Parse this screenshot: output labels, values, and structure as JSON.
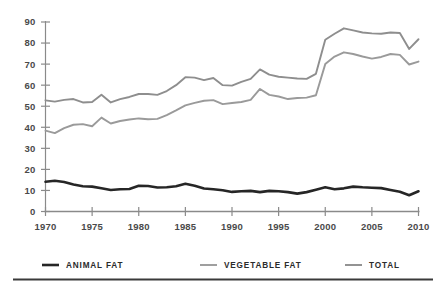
{
  "chart_data": {
    "type": "line",
    "title": "",
    "subtitle": "",
    "xlabel": "",
    "ylabel": "",
    "xlim": [
      1970,
      2010
    ],
    "ylim": [
      0,
      90
    ],
    "grid": false,
    "legend_position": "bottom",
    "y_ticks": [
      0,
      10,
      20,
      30,
      40,
      50,
      60,
      70,
      80,
      90
    ],
    "x_ticks": [
      1970,
      1975,
      1980,
      1985,
      1990,
      1995,
      2000,
      2005,
      2010
    ],
    "x": [
      1970,
      1971,
      1972,
      1973,
      1974,
      1975,
      1976,
      1977,
      1978,
      1979,
      1980,
      1981,
      1982,
      1983,
      1984,
      1985,
      1986,
      1987,
      1988,
      1989,
      1990,
      1991,
      1992,
      1993,
      1994,
      1995,
      1996,
      1997,
      1998,
      1999,
      2000,
      2001,
      2002,
      2003,
      2004,
      2005,
      2006,
      2007,
      2008,
      2009,
      2010
    ],
    "series": [
      {
        "name": "ANIMAL FAT",
        "color": "#262626",
        "width": 2.6,
        "values": [
          14.1,
          14.6,
          14.0,
          12.8,
          12.0,
          11.8,
          11.0,
          10.2,
          10.6,
          10.7,
          12.2,
          12.1,
          11.4,
          11.5,
          12.0,
          13.2,
          12.2,
          10.9,
          10.6,
          10.1,
          9.3,
          9.6,
          9.8,
          9.2,
          9.8,
          9.6,
          9.2,
          8.5,
          9.2,
          10.3,
          11.5,
          10.6,
          11.0,
          11.8,
          11.5,
          11.3,
          11.1,
          10.2,
          9.4,
          7.7,
          9.6
        ]
      },
      {
        "name": "VEGETABLE FAT",
        "color": "#9a9a9a",
        "width": 1.9,
        "values": [
          38.4,
          37.2,
          39.6,
          41.2,
          41.5,
          40.5,
          44.6,
          41.8,
          43.0,
          43.7,
          44.2,
          43.8,
          44.0,
          45.8,
          48.0,
          50.4,
          51.6,
          52.6,
          52.9,
          51.0,
          51.5,
          52.0,
          53.0,
          58.2,
          55.4,
          54.6,
          53.4,
          53.9,
          54.1,
          55.2,
          70.0,
          73.6,
          75.6,
          74.8,
          73.6,
          72.6,
          73.4,
          74.8,
          74.4,
          69.8,
          71.2
        ]
      },
      {
        "name": "TOTAL",
        "color": "#8e8e8e",
        "width": 1.9,
        "values": [
          52.8,
          52.2,
          53.0,
          53.4,
          51.8,
          52.0,
          55.4,
          51.8,
          53.4,
          54.4,
          55.8,
          55.8,
          55.4,
          57.2,
          60.0,
          63.8,
          63.6,
          62.4,
          63.4,
          60.0,
          59.8,
          61.6,
          63.0,
          67.5,
          65.0,
          64.0,
          63.6,
          63.2,
          63.0,
          65.4,
          81.6,
          84.4,
          87.0,
          86.0,
          85.0,
          84.6,
          84.4,
          85.0,
          84.8,
          77.2,
          81.8
        ]
      }
    ]
  },
  "legend": {
    "items": [
      {
        "label": "ANIMAL FAT",
        "color": "#262626"
      },
      {
        "label": "VEGETABLE FAT",
        "color": "#9a9a9a"
      },
      {
        "label": "TOTAL",
        "color": "#8e8e8e"
      }
    ]
  },
  "colors": {
    "axis": "#8a8a8a",
    "tick_text": "#4a4a4a",
    "background": "#ffffff",
    "footer_rule": "#3a3a3a"
  }
}
